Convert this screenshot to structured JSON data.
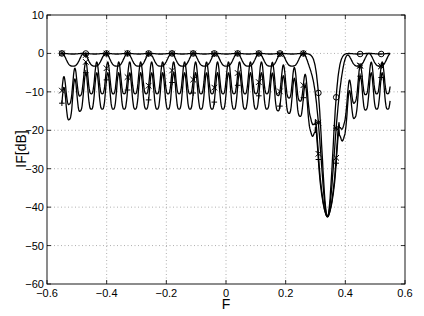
{
  "chart_data": {
    "type": "line",
    "title": "",
    "xlabel": "F",
    "ylabel": "IF[dB]",
    "xlim": [
      -0.6,
      0.6
    ],
    "ylim": [
      -60,
      10
    ],
    "xticks": [
      -0.6,
      -0.4,
      -0.2,
      0,
      0.2,
      0.4,
      0.6
    ],
    "xtick_labels": [
      "-0.6",
      "-0.4",
      "-0.2",
      "0",
      "0.2",
      "0.4",
      "0.6"
    ],
    "yticks": [
      -60,
      -50,
      -40,
      -30,
      -20,
      -10,
      0,
      10
    ],
    "ytick_labels": [
      "-60",
      "-50",
      "-40",
      "-30",
      "-20",
      "-10",
      "0",
      "10"
    ],
    "grid": true,
    "legend": null,
    "notch": {
      "F": 0.34,
      "min_dB": -42.5
    },
    "series": [
      {
        "name": "curve-o",
        "marker": "o",
        "ripple_period": 0.0735,
        "x": [
          -0.55,
          -0.47,
          -0.4,
          -0.33,
          -0.26,
          -0.18,
          -0.11,
          -0.04,
          0.04,
          0.11,
          0.18,
          0.26,
          0.29,
          0.31,
          0.34,
          0.37,
          0.4,
          0.44,
          0.5,
          0.55
        ],
        "values": [
          0,
          0,
          0,
          0,
          0,
          0,
          0,
          0,
          0,
          0,
          -0.1,
          -0.3,
          -1,
          -8,
          -42,
          -6,
          -1,
          -0.2,
          0,
          0
        ]
      },
      {
        "name": "curve-star",
        "marker": "*",
        "ripple_period": 0.0735,
        "x": [
          -0.55,
          -0.51,
          -0.47,
          -0.44,
          -0.4,
          -0.36,
          -0.33,
          -0.29,
          -0.26,
          -0.22,
          -0.18,
          -0.15,
          -0.11,
          -0.07,
          -0.04,
          0.0,
          0.04,
          0.07,
          0.11,
          0.15,
          0.18,
          0.22,
          0.26,
          0.29,
          0.34,
          0.37,
          0.4,
          0.44,
          0.47,
          0.51,
          0.55
        ],
        "values": [
          -2.5,
          -3.2,
          0,
          -3.2,
          0,
          -3.2,
          0,
          -3.2,
          0,
          -3.2,
          0,
          -3.2,
          0,
          -3.2,
          0,
          -3.2,
          0,
          -3.2,
          0,
          -3.5,
          0,
          -3.8,
          0,
          -6,
          -42,
          -8,
          -2,
          -4,
          0,
          -3.5,
          -0.5
        ]
      },
      {
        "name": "curve-x",
        "marker": "x",
        "ripple_period": 0.0368,
        "x": [
          -0.55,
          -0.51,
          -0.47,
          -0.44,
          -0.4,
          -0.36,
          -0.33,
          -0.29,
          -0.26,
          -0.22,
          -0.18,
          -0.15,
          -0.11,
          -0.07,
          -0.04,
          0.0,
          0.04,
          0.07,
          0.11,
          0.15,
          0.18,
          0.22,
          0.26,
          0.29,
          0.34,
          0.37,
          0.4,
          0.44,
          0.47,
          0.51,
          0.55
        ],
        "values": [
          -9,
          -12,
          -3,
          -11,
          -2,
          -10,
          -2,
          -10,
          -2,
          -10,
          -2,
          -10,
          -2,
          -10,
          -2,
          -10,
          -2,
          -11,
          -2.5,
          -12,
          -3,
          -13,
          -3,
          -8,
          -42,
          -15,
          -10,
          -8,
          -12,
          -3,
          -7
        ]
      },
      {
        "name": "curve-plus",
        "marker": "+",
        "ripple_period": 0.0368,
        "x": [
          -0.55,
          -0.51,
          -0.47,
          -0.44,
          -0.4,
          -0.36,
          -0.33,
          -0.29,
          -0.26,
          -0.22,
          -0.18,
          -0.15,
          -0.11,
          -0.07,
          -0.04,
          0.0,
          0.04,
          0.07,
          0.11,
          0.15,
          0.18,
          0.22,
          0.26,
          0.29,
          0.34,
          0.37,
          0.4,
          0.44,
          0.47,
          0.51,
          0.55
        ],
        "values": [
          -12,
          -17.5,
          -6,
          -15,
          -5,
          -14,
          -5,
          -14,
          -5,
          -14,
          -5,
          -14,
          -5,
          -14,
          -5,
          -14,
          -5,
          -15,
          -5,
          -16,
          -6,
          -17,
          -6,
          -10,
          -42,
          -20,
          -14,
          -11,
          -15,
          -6,
          -11
        ]
      }
    ]
  }
}
